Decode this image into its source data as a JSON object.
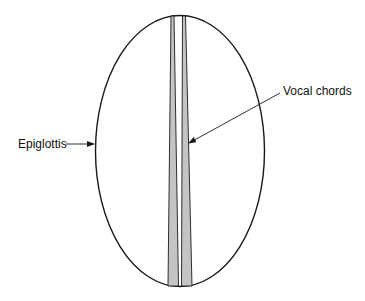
{
  "diagram": {
    "type": "anatomical-schematic",
    "labels": {
      "epiglottis": "Epiglottis",
      "vocal_chords": "Vocal chords"
    },
    "colors": {
      "outline": "#1a1a1a",
      "chord_fill": "#c4c4c4",
      "background": "#ffffff",
      "text": "#111111"
    }
  }
}
